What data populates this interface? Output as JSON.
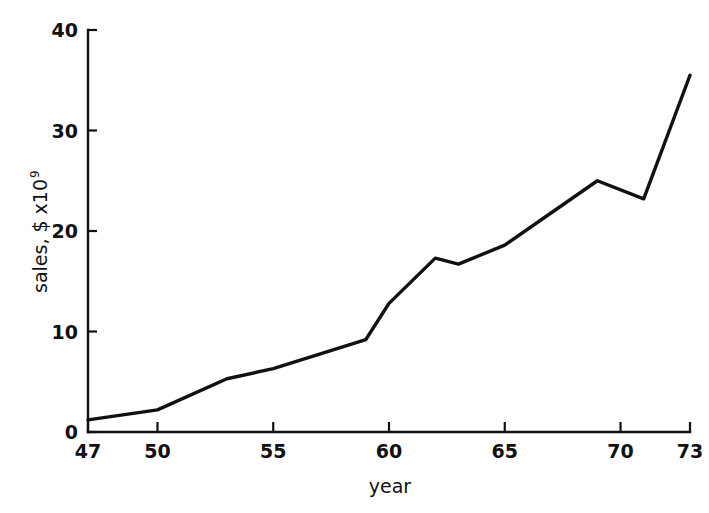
{
  "chart_data": {
    "type": "line",
    "title": "",
    "xlabel": "year",
    "ylabel": "sales, $ x10",
    "ylabel_superscript": "9",
    "xlim": [
      47,
      73
    ],
    "ylim": [
      0,
      40
    ],
    "grid": false,
    "legend": null,
    "line_color": "#111111",
    "background_color": "#ffffff",
    "xticks": [
      47,
      50,
      55,
      60,
      65,
      70,
      73
    ],
    "xtick_labels": [
      "47",
      "50",
      "55",
      "60",
      "65",
      "70",
      "73"
    ],
    "yticks": [
      0,
      10,
      20,
      30,
      40
    ],
    "ytick_labels": [
      "0",
      "10",
      "20",
      "30",
      "40"
    ],
    "x": [
      47,
      50,
      53,
      55,
      59,
      60,
      62,
      63,
      65,
      69,
      71,
      73
    ],
    "values": [
      1.2,
      2.2,
      5.3,
      6.3,
      9.2,
      12.8,
      17.3,
      16.7,
      18.6,
      25.0,
      23.2,
      35.5
    ],
    "series": [
      {
        "name": "sales",
        "points": [
          {
            "x": 47,
            "y": 1.2
          },
          {
            "x": 50,
            "y": 2.2
          },
          {
            "x": 53,
            "y": 5.3
          },
          {
            "x": 55,
            "y": 6.3
          },
          {
            "x": 59,
            "y": 9.2
          },
          {
            "x": 60,
            "y": 12.8
          },
          {
            "x": 62,
            "y": 17.3
          },
          {
            "x": 63,
            "y": 16.7
          },
          {
            "x": 65,
            "y": 18.6
          },
          {
            "x": 69,
            "y": 25.0
          },
          {
            "x": 71,
            "y": 23.2
          },
          {
            "x": 73,
            "y": 35.5
          }
        ]
      }
    ]
  }
}
